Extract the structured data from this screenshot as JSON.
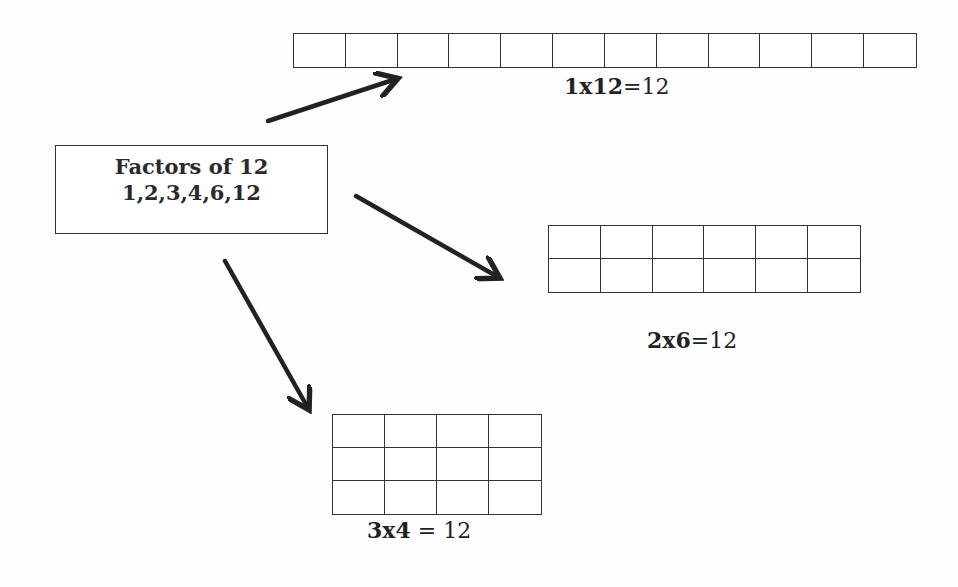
{
  "diagram": {
    "title": "Factors of 12",
    "factors_label": "Factors of 12",
    "factors_list": "1,2,3,4,6,12",
    "colors": {
      "background": "#ffffff",
      "lines": "#333333",
      "arrows": "#222222",
      "text": "#222222"
    },
    "arrays": [
      {
        "id": "1x12",
        "rows": 1,
        "cols": 12,
        "equation_lhs": "1x12",
        "equation_rhs": "=12"
      },
      {
        "id": "2x6",
        "rows": 2,
        "cols": 6,
        "equation_lhs": "2x6",
        "equation_rhs": "=12"
      },
      {
        "id": "3x4",
        "rows": 3,
        "cols": 4,
        "equation_lhs": "3x4",
        "equation_rhs": " = 12"
      }
    ],
    "arrows": [
      {
        "from": "factors-box",
        "to": "array-1x12",
        "x1": 268,
        "y1": 121,
        "x2": 396,
        "y2": 79
      },
      {
        "from": "factors-box",
        "to": "array-2x6",
        "x1": 356,
        "y1": 196,
        "x2": 498,
        "y2": 277
      },
      {
        "from": "factors-box",
        "to": "array-3x4",
        "x1": 225,
        "y1": 261,
        "x2": 308,
        "y2": 408
      }
    ]
  }
}
